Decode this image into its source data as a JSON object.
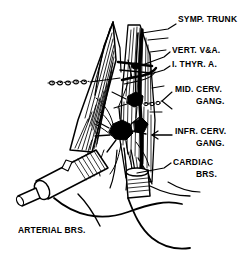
{
  "figure": {
    "background_color": "#ffffff",
    "ink_color": "#000000",
    "width": 247,
    "height": 264
  },
  "labels": [
    {
      "id": "symp-trunk",
      "text": "SYMP. TRUNK",
      "x": 178,
      "y": 18,
      "leader": {
        "type": "line",
        "x1": 168,
        "y1": 28,
        "x2": 143,
        "y2": 33
      }
    },
    {
      "id": "vert-v-a",
      "text": "VERT. V&A.",
      "x": 172,
      "y": 49,
      "leader": {
        "type": "line",
        "x1": 168,
        "y1": 58,
        "x2": 138,
        "y2": 68
      }
    },
    {
      "id": "i-thyr-a",
      "text": "I. THYR. A.",
      "x": 172,
      "y": 63,
      "leader": {
        "type": "line",
        "x1": 168,
        "y1": 71,
        "x2": 140,
        "y2": 77
      }
    },
    {
      "id": "mid-cerv-gang-line1",
      "text": "MID. CERV.",
      "x": 175,
      "y": 88,
      "leader": {
        "type": "forked-dotted",
        "x1": 170,
        "y1": 100,
        "x2": 148,
        "y2": 104
      }
    },
    {
      "id": "mid-cerv-gang-line2",
      "text": "GANG.",
      "x": 196,
      "y": 101
    },
    {
      "id": "infr-cerv-gang-line1",
      "text": "INFR. CERV.",
      "x": 175,
      "y": 130,
      "leader": {
        "type": "arrow",
        "x1": 172,
        "y1": 135,
        "x2": 150,
        "y2": 135
      }
    },
    {
      "id": "infr-cerv-gang-line2",
      "text": "GANG.",
      "x": 196,
      "y": 143
    },
    {
      "id": "cardiac-brs-line1",
      "text": "CARDIAC",
      "x": 173,
      "y": 161,
      "leader": {
        "type": "line",
        "x1": 169,
        "y1": 166,
        "x2": 138,
        "y2": 172
      }
    },
    {
      "id": "cardiac-brs-line2",
      "text": "BRS.",
      "x": 196,
      "y": 174
    },
    {
      "id": "arterial-brs",
      "text": "ARTERIAL  BRS.",
      "x": 18,
      "y": 229,
      "leader": {
        "type": "long-curve",
        "x1": 100,
        "y1": 228,
        "x2": 78,
        "y2": 195
      }
    }
  ],
  "structures": [
    {
      "name": "sternomastoid-muscle-hatched",
      "region": "upper-left-wedge"
    },
    {
      "name": "scalene-muscle-hatched",
      "region": "right-column"
    },
    {
      "name": "sympathetic-trunk-cord",
      "region": "vertical-center-right"
    },
    {
      "name": "middle-cervical-ganglion",
      "region": "center"
    },
    {
      "name": "inferior-cervical-ganglion",
      "region": "center-lower"
    },
    {
      "name": "vertebral-vessels",
      "region": "upper-center"
    },
    {
      "name": "inferior-thyroid-artery",
      "region": "upper-center"
    },
    {
      "name": "cardiac-branches",
      "region": "lower-center"
    },
    {
      "name": "clavicle-stump-cylinder",
      "region": "lower-left"
    },
    {
      "name": "vessel-stump-cylinder",
      "region": "lower-right"
    },
    {
      "name": "body-contour-curves",
      "region": "bottom"
    }
  ]
}
